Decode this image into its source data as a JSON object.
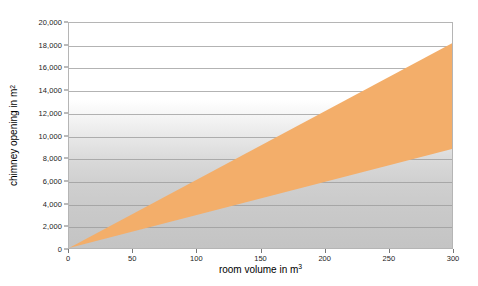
{
  "chart_data": {
    "type": "area",
    "title": "",
    "subtitle": "",
    "xlabel": "room volume in m",
    "xlabel_sup": "3",
    "ylabel": "chimney opening in m",
    "ylabel_sup": "2",
    "xlim": [
      0,
      300
    ],
    "ylim": [
      0,
      20000
    ],
    "x_ticks": [
      "0",
      "50",
      "100",
      "150",
      "200",
      "250",
      "300"
    ],
    "x_tick_values": [
      0,
      50,
      100,
      150,
      200,
      250,
      300
    ],
    "y_ticks": [
      "0",
      "2,000",
      "4,000",
      "6,000",
      "8,000",
      "10,000",
      "12,000",
      "14,000",
      "16,000",
      "18,000",
      "20,000"
    ],
    "y_tick_values": [
      0,
      2000,
      4000,
      6000,
      8000,
      10000,
      12000,
      14000,
      16000,
      18000,
      20000
    ],
    "grid": true,
    "legend": "none",
    "x": [
      0,
      300
    ],
    "series": [
      {
        "name": "upper bound",
        "values": [
          0,
          18200
        ]
      },
      {
        "name": "lower bound",
        "values": [
          0,
          8800
        ]
      }
    ],
    "band": {
      "fill_color": "#f3ae6a",
      "x_start": 0,
      "x_end": 300,
      "upper_slope": 60.7,
      "lower_slope": 29.3
    },
    "colors": {
      "band": "#f3ae6a",
      "gridline": "#9a9a9a",
      "axis_border": "#b5b5b5",
      "plot_bg_top": "#ffffff",
      "plot_bg_bottom": "#c4c4c4",
      "text": "#1c1c1c"
    }
  }
}
